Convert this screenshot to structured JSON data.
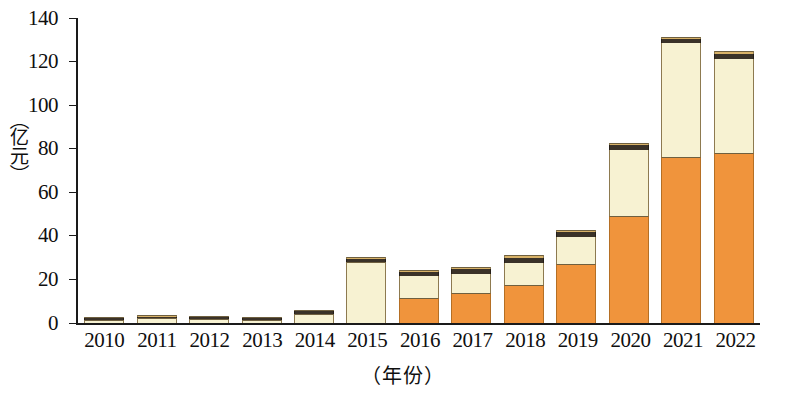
{
  "chart_data": {
    "type": "bar",
    "title": "",
    "subtitle": "",
    "stacked": true,
    "xlabel": "（年份）",
    "ylabel": "（亿元）",
    "ylim": [
      0,
      140
    ],
    "yticks": [
      0,
      20,
      40,
      60,
      80,
      100,
      120,
      140
    ],
    "ytick_labels": [
      "0",
      "20",
      "40",
      "60",
      "80",
      "100",
      "120",
      "140"
    ],
    "grid": false,
    "legend": "none",
    "categories": [
      "2010",
      "2011",
      "2012",
      "2013",
      "2014",
      "2015",
      "2016",
      "2017",
      "2018",
      "2019",
      "2020",
      "2021",
      "2022"
    ],
    "series": [
      {
        "name": "series-1-orange",
        "color": "#F0943C",
        "values": [
          0.0,
          0.0,
          0.0,
          0.0,
          0.0,
          0.0,
          11.5,
          14.0,
          17.5,
          27.0,
          49.0,
          76.0,
          78.0
        ]
      },
      {
        "name": "series-2-cream",
        "color": "#F7F2D2",
        "values": [
          1.4,
          2.2,
          2.0,
          1.6,
          4.2,
          28.0,
          10.0,
          8.5,
          10.0,
          12.5,
          30.5,
          52.5,
          43.0
        ]
      },
      {
        "name": "series-3-dark",
        "color": "#3A3228",
        "values": [
          0.5,
          0.7,
          0.6,
          0.5,
          1.2,
          1.6,
          1.8,
          2.2,
          2.5,
          2.2,
          2.2,
          2.0,
          2.5
        ]
      },
      {
        "name": "series-4-tan-cap",
        "color": "#D8B268",
        "values": [
          0.4,
          0.5,
          0.5,
          0.4,
          0.7,
          0.8,
          0.9,
          1.0,
          1.1,
          1.0,
          1.0,
          1.0,
          1.2
        ]
      }
    ],
    "totals": [
      2.3,
      3.4,
      3.1,
      2.5,
      6.1,
      30.4,
      24.2,
      25.7,
      31.1,
      42.7,
      82.7,
      131.5,
      124.7
    ]
  },
  "axis": {
    "y_tick_0": "0",
    "y_tick_20": "20",
    "y_tick_40": "40",
    "y_tick_60": "60",
    "y_tick_80": "80",
    "y_tick_100": "100",
    "y_tick_120": "120",
    "y_tick_140": "140"
  },
  "ylabel_chars": {
    "open": "（",
    "c1": "亿",
    "c2": "元",
    "close": "）"
  }
}
